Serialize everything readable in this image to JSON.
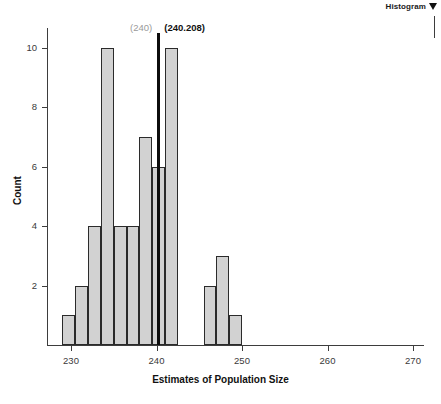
{
  "selector": {
    "label": "Histogram",
    "dropdown_icon": "chevron-down-icon"
  },
  "annotations": [
    {
      "text": "(240)",
      "style": "gray",
      "value": 240
    },
    {
      "text": "(240.208)",
      "style": "bold",
      "value": 240.208
    }
  ],
  "axis_titles": {
    "x": "Estimates of Population Size",
    "y": "Count"
  },
  "chart_data": {
    "type": "bar",
    "title": "",
    "subtitle": "",
    "xlabel": "Estimates of Population Size",
    "ylabel": "Count",
    "xlim": [
      228.3,
      272.5
    ],
    "ylim": [
      0,
      11.2
    ],
    "grid": false,
    "legend": null,
    "xticks": [
      230,
      240,
      250,
      260,
      270
    ],
    "xticklabels": [
      "230",
      "240",
      "250",
      "260",
      "270"
    ],
    "yticks": [
      2,
      4,
      6,
      8,
      10
    ],
    "yticklabels": [
      "2",
      "4",
      "6",
      "8",
      "10"
    ],
    "bin_width": 1.5,
    "bins": [
      {
        "left": 229.0,
        "right": 230.5,
        "count": 1
      },
      {
        "left": 230.5,
        "right": 232.0,
        "count": 2
      },
      {
        "left": 232.0,
        "right": 233.5,
        "count": 4
      },
      {
        "left": 233.5,
        "right": 235.0,
        "count": 10
      },
      {
        "left": 235.0,
        "right": 236.5,
        "count": 4
      },
      {
        "left": 236.5,
        "right": 238.0,
        "count": 4
      },
      {
        "left": 238.0,
        "right": 239.5,
        "count": 7
      },
      {
        "left": 239.5,
        "right": 241.0,
        "count": 6
      },
      {
        "left": 241.0,
        "right": 242.5,
        "count": 10
      },
      {
        "left": 245.5,
        "right": 247.0,
        "count": 2
      },
      {
        "left": 247.0,
        "right": 248.5,
        "count": 3
      },
      {
        "left": 248.5,
        "right": 250.0,
        "count": 1
      }
    ],
    "reference_lines": [
      {
        "value": 240.208,
        "label": "(240.208)",
        "color": "#0d0d0d"
      }
    ],
    "colors": {
      "bar_fill": "#d2d2d2",
      "bar_edge": "#2b2b2b",
      "reference_line": "#0d0d0d",
      "annotation_gray": "#9a9a9a",
      "annotation_bold": "#111111",
      "axis": "#3d3d3d"
    }
  }
}
